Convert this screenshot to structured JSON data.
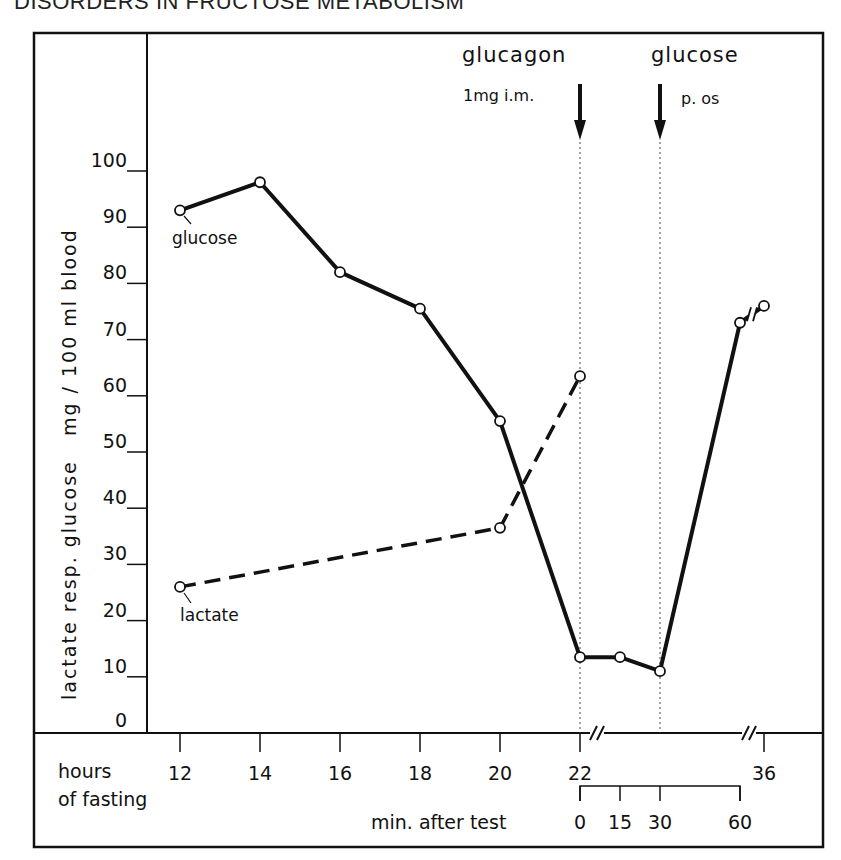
{
  "page": {
    "header_text": "DISORDERS IN FRUCTOSE METABOLISM"
  },
  "chart_data": {
    "type": "line",
    "title": "",
    "ylabel": "lactate resp. glucose   mg / 100 ml blood",
    "xlabel": "hours of fasting",
    "xlabel_line1": "hours",
    "xlabel_line2": "of fasting",
    "secondary_xlabel": "min. after test",
    "ylim": [
      0,
      100
    ],
    "y_ticks": [
      "0",
      "10",
      "20",
      "30",
      "40",
      "50",
      "60",
      "70",
      "80",
      "90",
      "100"
    ],
    "x_ticks": [
      "12",
      "14",
      "16",
      "18",
      "20",
      "22",
      "36"
    ],
    "secondary_x_ticks": [
      "0",
      "15",
      "30",
      "60"
    ],
    "grid": false,
    "annotations": [
      {
        "label": "glucagon",
        "sublabel": "1mg i.m.",
        "at": "22 h / 0 min",
        "type": "down-arrow"
      },
      {
        "label": "glucose",
        "sublabel": "p. os",
        "at": "30 min",
        "type": "down-arrow"
      }
    ],
    "series": [
      {
        "name": "glucose",
        "style": "solid",
        "points": [
          {
            "x": "12 h",
            "y": 93
          },
          {
            "x": "14 h",
            "y": 98
          },
          {
            "x": "16 h",
            "y": 82
          },
          {
            "x": "18 h",
            "y": 75.5
          },
          {
            "x": "20 h",
            "y": 55.5
          },
          {
            "x": "22 h (0 min)",
            "y": 13.5
          },
          {
            "x": "15 min",
            "y": 13.5
          },
          {
            "x": "30 min",
            "y": 11
          },
          {
            "x": "60 min",
            "y": 73
          },
          {
            "x": "36 h",
            "y": 76
          }
        ]
      },
      {
        "name": "lactate",
        "style": "dashed",
        "points": [
          {
            "x": "12 h",
            "y": 26
          },
          {
            "x": "20 h",
            "y": 36.5
          },
          {
            "x": "22 h (0 min)",
            "y": 63.5
          }
        ]
      }
    ],
    "series_labels": {
      "glucose": "glucose",
      "lactate": "lactate"
    }
  }
}
